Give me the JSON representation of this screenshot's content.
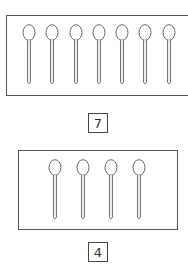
{
  "groups": [
    {
      "item": "spoon",
      "count_label": "7",
      "spoon_centers": [
        29,
        52,
        76,
        99,
        122,
        145,
        169
      ],
      "box": {
        "left": 6,
        "top": 15,
        "width": 184,
        "height": 81
      },
      "spoon_top": 24,
      "label_box": {
        "left": 88,
        "top": 113
      }
    },
    {
      "item": "spoon",
      "count_label": "4",
      "spoon_centers": [
        55,
        83,
        111,
        139
      ],
      "box": {
        "left": 18,
        "top": 150,
        "width": 160,
        "height": 80
      },
      "spoon_top": 159,
      "label_box": {
        "left": 88,
        "top": 242
      }
    }
  ],
  "colors": {
    "stroke": "#555555",
    "text": "#333333"
  }
}
